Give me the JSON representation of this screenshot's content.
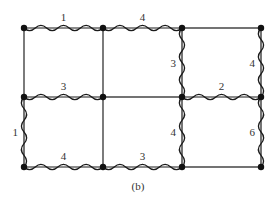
{
  "diagram": {
    "caption": "(b)",
    "colors": {
      "line": "#1a1a1a",
      "node": "#111111",
      "label": "#333333",
      "background": "#ffffff"
    },
    "grid": {
      "cols_x": [
        24,
        103,
        182,
        261
      ],
      "rows_y": [
        28,
        97,
        167
      ]
    },
    "nodes": [
      {
        "id": "n00",
        "x": 24,
        "y": 28
      },
      {
        "id": "n01",
        "x": 103,
        "y": 28
      },
      {
        "id": "n02",
        "x": 182,
        "y": 28
      },
      {
        "id": "n03",
        "x": 261,
        "y": 28
      },
      {
        "id": "n10",
        "x": 24,
        "y": 97
      },
      {
        "id": "n11",
        "x": 103,
        "y": 97
      },
      {
        "id": "n12",
        "x": 182,
        "y": 97
      },
      {
        "id": "n13",
        "x": 261,
        "y": 97
      },
      {
        "id": "n20",
        "x": 24,
        "y": 167
      },
      {
        "id": "n21",
        "x": 103,
        "y": 167
      },
      {
        "id": "n22",
        "x": 182,
        "y": 167
      },
      {
        "id": "n23",
        "x": 261,
        "y": 167
      }
    ],
    "edges": [
      {
        "from": "n00",
        "to": "n01",
        "style": "wavy",
        "label": "1"
      },
      {
        "from": "n01",
        "to": "n02",
        "style": "wavy",
        "label": "4"
      },
      {
        "from": "n02",
        "to": "n03",
        "style": "straight",
        "label": ""
      },
      {
        "from": "n10",
        "to": "n11",
        "style": "wavy",
        "label": "3"
      },
      {
        "from": "n11",
        "to": "n12",
        "style": "straight",
        "label": ""
      },
      {
        "from": "n12",
        "to": "n13",
        "style": "wavy",
        "label": "2"
      },
      {
        "from": "n20",
        "to": "n21",
        "style": "wavy",
        "label": "4"
      },
      {
        "from": "n21",
        "to": "n22",
        "style": "wavy",
        "label": "3"
      },
      {
        "from": "n22",
        "to": "n23",
        "style": "straight",
        "label": ""
      },
      {
        "from": "n00",
        "to": "n10",
        "style": "straight",
        "label": ""
      },
      {
        "from": "n01",
        "to": "n11",
        "style": "straight",
        "label": ""
      },
      {
        "from": "n02",
        "to": "n12",
        "style": "wavy",
        "label": "3"
      },
      {
        "from": "n03",
        "to": "n13",
        "style": "wavy",
        "label": "4"
      },
      {
        "from": "n10",
        "to": "n20",
        "style": "wavy",
        "label": "1"
      },
      {
        "from": "n11",
        "to": "n21",
        "style": "straight",
        "label": ""
      },
      {
        "from": "n12",
        "to": "n22",
        "style": "wavy",
        "label": "4"
      },
      {
        "from": "n13",
        "to": "n23",
        "style": "wavy",
        "label": "6"
      }
    ]
  }
}
